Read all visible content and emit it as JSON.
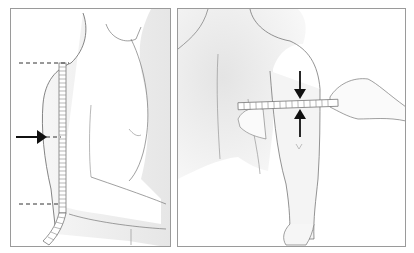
{
  "figure": {
    "panels": [
      {
        "id": "left",
        "depiction": "side-view-upper-arm-length-measurement",
        "elements": [
          "torso-outline",
          "upper-arm-outline",
          "measuring-tape-vertical",
          "dashed-line-top",
          "dashed-line-mid",
          "dashed-line-bottom",
          "arrow-right"
        ]
      },
      {
        "id": "right",
        "depiction": "back-view-upper-arm-circumference-measurement",
        "elements": [
          "back-outline",
          "arm-outline",
          "hand-holding-tape",
          "measuring-tape-horizontal",
          "arrow-down",
          "arrow-up"
        ]
      }
    ],
    "colors": {
      "frame": "#9a9a9a",
      "line": "#555555",
      "skin_shade": "#ececec",
      "arrow": "#111111",
      "dash": "#333333"
    }
  }
}
